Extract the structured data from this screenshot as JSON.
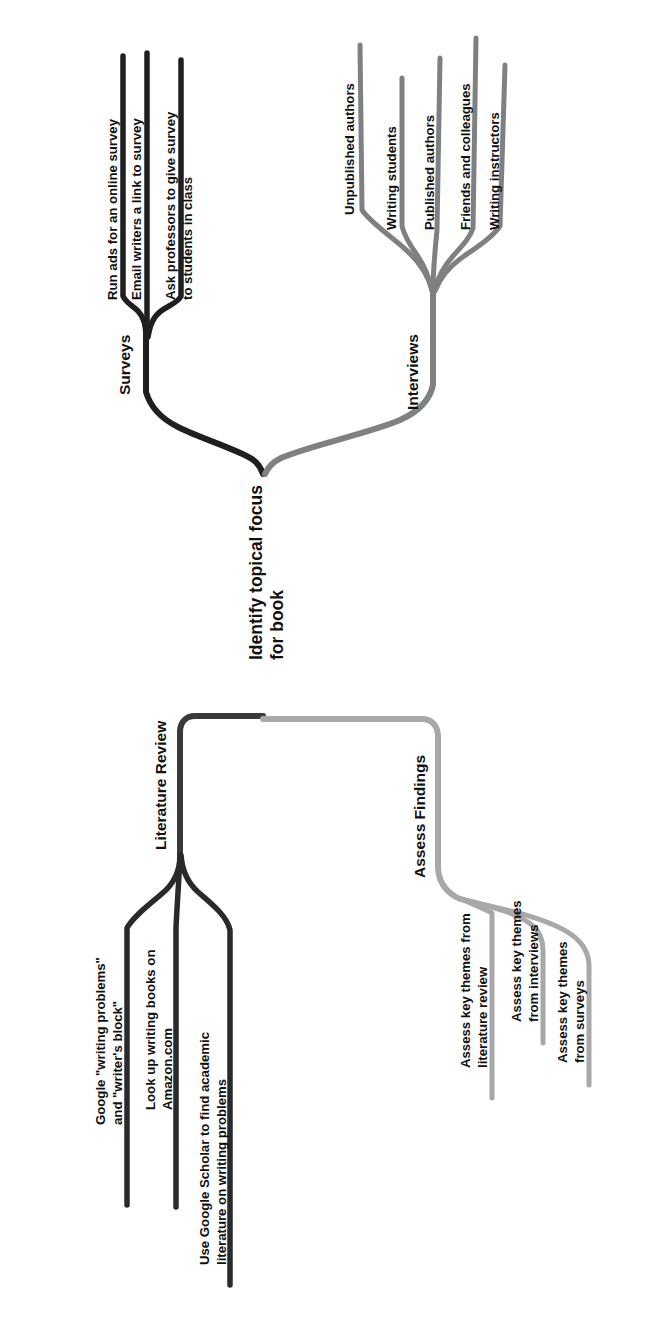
{
  "diagram": {
    "title": "Identify topical focus for book",
    "orientation": "rotated-90-counterclockwise",
    "background_color": "#ffffff",
    "root": {
      "label_line1": "Identify topical focus",
      "label_line2": "for book",
      "full_label": "Identify topical focus for book"
    },
    "colors": {
      "dark_branch": "#1f1f1f",
      "medium_branch": "#808080",
      "light_branch": "#a8a8a8",
      "text": "#111111"
    },
    "branches": [
      {
        "id": "surveys",
        "label": "Surveys",
        "color": "#1f1f1f",
        "leaves": [
          {
            "line1": "Run ads for an online survey",
            "line2": "",
            "full": "Run ads for an online survey"
          },
          {
            "line1": "Email writers a link to survey",
            "line2": "",
            "full": "Email writers a link to survey"
          },
          {
            "line1": "Ask professors to give survey",
            "line2": "to students in class",
            "full": "Ask professors to give survey to students in class"
          }
        ]
      },
      {
        "id": "interviews",
        "label": "Interviews",
        "color": "#808080",
        "leaves": [
          {
            "line1": "Unpublished authors",
            "line2": "",
            "full": "Unpublished authors"
          },
          {
            "line1": "Writing students",
            "line2": "",
            "full": "Writing students"
          },
          {
            "line1": "Published authors",
            "line2": "",
            "full": "Published authors"
          },
          {
            "line1": "Friends and colleagues",
            "line2": "",
            "full": "Friends and colleagues"
          },
          {
            "line1": "Writing instructors",
            "line2": "",
            "full": "Writing instructors"
          }
        ]
      },
      {
        "id": "literature-review",
        "label": "Literature Review",
        "color": "#1f1f1f",
        "leaves": [
          {
            "line1": "Google \"writing problems\"",
            "line2": "and \"writer's block\"",
            "full": "Google \"writing problems\" and \"writer's block\""
          },
          {
            "line1": "Look up writing books on",
            "line2": "Amazon.com",
            "full": "Look up writing books on Amazon.com"
          },
          {
            "line1": "Use Google Scholar to find academic",
            "line2": "literature on writing problems",
            "full": "Use Google Scholar to find academic literature on writing problems"
          }
        ]
      },
      {
        "id": "assess-findings",
        "label": "Assess Findings",
        "color": "#a8a8a8",
        "leaves": [
          {
            "line1": "Assess key themes from",
            "line2": "literature review",
            "full": "Assess key themes from literature review"
          },
          {
            "line1": "Assess key themes",
            "line2": "from interviews",
            "full": "Assess key themes from interviews"
          },
          {
            "line1": "Assess key themes",
            "line2": "from surveys",
            "full": "Assess key themes from surveys"
          }
        ]
      }
    ]
  }
}
